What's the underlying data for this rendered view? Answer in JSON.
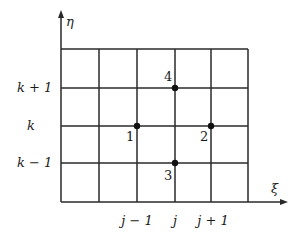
{
  "diagram": {
    "axes": {
      "vertical_label": "η",
      "horizontal_label": "ξ"
    },
    "row_labels": [
      {
        "text": "k + 1",
        "y": 88
      },
      {
        "text": "k",
        "y": 126
      },
      {
        "text": "k − 1",
        "y": 163
      }
    ],
    "column_labels": [
      {
        "text": "j − 1",
        "x": 137
      },
      {
        "text": "j",
        "x": 175
      },
      {
        "text": "j + 1",
        "x": 211
      }
    ],
    "grid": {
      "vertical_lines_x": [
        61,
        99,
        137,
        175,
        211,
        248
      ],
      "horizontal_lines_y": [
        49,
        88,
        126,
        163,
        202
      ]
    },
    "points": [
      {
        "label": "1",
        "x": 137,
        "y": 126
      },
      {
        "label": "2",
        "x": 211,
        "y": 126
      },
      {
        "label": "3",
        "x": 175,
        "y": 163
      },
      {
        "label": "4",
        "x": 175,
        "y": 88
      }
    ],
    "colors": {
      "line": "#2a2a2a",
      "background": "#ffffff"
    }
  }
}
